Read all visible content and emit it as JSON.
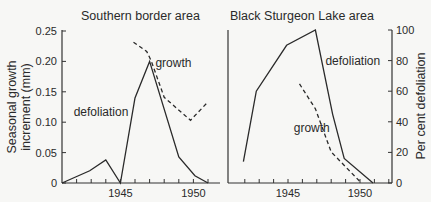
{
  "chart_data": [
    {
      "type": "line",
      "title": "Southern border area",
      "xlabel": "",
      "ylabel_left": "Seasonal growth increment (mm)",
      "ylabel_right": "Per cent defoliation",
      "xlim": [
        1941,
        1952
      ],
      "ylim_left": [
        0,
        0.25
      ],
      "ylim_right": [
        0,
        100
      ],
      "x_tick_labels": [
        {
          "x": 1945,
          "label": "1945"
        },
        {
          "x": 1950,
          "label": "1950"
        }
      ],
      "x_ticks": [
        1942,
        1943,
        1944,
        1945,
        1946,
        1947,
        1948,
        1949,
        1950,
        1951
      ],
      "y_ticks_left": [
        {
          "v": 0,
          "label": "0"
        },
        {
          "v": 0.05,
          "label": "0.05"
        },
        {
          "v": 0.1,
          "label": "0.10"
        },
        {
          "v": 0.15,
          "label": "0.15"
        },
        {
          "v": 0.2,
          "label": "0.20"
        },
        {
          "v": 0.25,
          "label": "0.25"
        }
      ],
      "series": [
        {
          "name": "growth",
          "style": "solid",
          "axis": "left",
          "x": [
            1941,
            1942.9,
            1944,
            1945,
            1946,
            1947,
            1949,
            1950.1,
            1951
          ],
          "y": [
            0,
            0.02,
            0.038,
            0,
            0.14,
            0.2,
            0.043,
            0.012,
            0
          ]
        },
        {
          "name": "defoliation",
          "style": "dashed",
          "axis": "right",
          "x": [
            1945.9,
            1946.8,
            1947.1,
            1948,
            1949.8,
            1951
          ],
          "y": [
            92,
            86,
            80,
            56,
            41,
            53
          ]
        }
      ],
      "annotations": [
        {
          "text": "growth",
          "x": 1947.4,
          "y_left": 0.19
        },
        {
          "text": "defoliation",
          "x": 1941.8,
          "y_left": 0.11
        }
      ]
    },
    {
      "type": "line",
      "title": "Black Sturgeon Lake area",
      "xlabel": "",
      "ylabel_right": "Per cent defoliation",
      "xlim": [
        1941,
        1952.3
      ],
      "ylim_right": [
        0,
        100
      ],
      "ylim_growth": [
        0,
        0.25
      ],
      "x_tick_labels": [
        {
          "x": 1945,
          "label": "1945"
        },
        {
          "x": 1950,
          "label": "1950"
        }
      ],
      "x_ticks": [
        1942,
        1943,
        1944,
        1945,
        1946,
        1947,
        1948,
        1949,
        1950,
        1951,
        1952
      ],
      "y_ticks_right": [
        {
          "v": 0,
          "label": "0"
        },
        {
          "v": 20,
          "label": "20"
        },
        {
          "v": 40,
          "label": "40"
        },
        {
          "v": 60,
          "label": "60"
        },
        {
          "v": 80,
          "label": "80"
        },
        {
          "v": 100,
          "label": "100"
        }
      ],
      "series": [
        {
          "name": "defoliation",
          "style": "solid",
          "axis": "right",
          "x": [
            1941.9,
            1942.8,
            1944.9,
            1946.9,
            1948.1,
            1948.9,
            1950.9
          ],
          "y": [
            14,
            60,
            90,
            100,
            45,
            16,
            0
          ]
        },
        {
          "name": "growth",
          "style": "dashed",
          "axis": "growth",
          "x": [
            1945.8,
            1946.9,
            1948,
            1950.1
          ],
          "y": [
            0.163,
            0.122,
            0.051,
            0
          ]
        }
      ],
      "annotations": [
        {
          "text": "defoliation",
          "x": 1947.6,
          "y_right": 80
        },
        {
          "text": "growth",
          "x": 1945.4,
          "y_right": 36
        }
      ]
    }
  ]
}
